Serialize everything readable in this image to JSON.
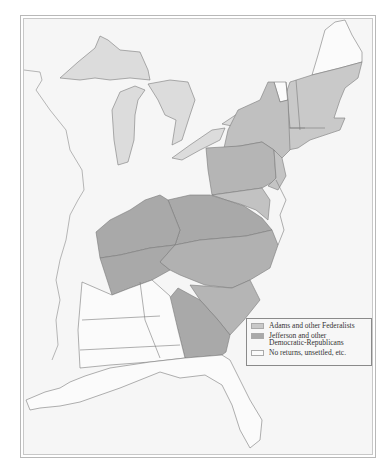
{
  "map": {
    "type": "historical election map",
    "region": "Eastern United States",
    "colors": {
      "federalist": "#c9c9c9",
      "democratic_republican": "#a9a9a9",
      "no_returns": "#fbfbfb",
      "water": "#dcdcdc",
      "land_background": "#f6f6f6",
      "border": "#7a7a7a"
    }
  },
  "legend": {
    "items": [
      {
        "label": "Adams and other Federalists",
        "color": "#c9c9c9"
      },
      {
        "label": "Jefferson and other\nDemocratic-Republicans",
        "color": "#a9a9a9"
      },
      {
        "label": "No returns, unsettled, etc.",
        "color": "#fbfbfb"
      }
    ]
  }
}
